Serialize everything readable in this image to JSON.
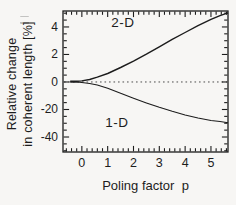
{
  "figure": {
    "background": "#f7f6f4",
    "line_color": "#1c1c1c",
    "zero_line_color": "#3a3a3a"
  },
  "chart_data": {
    "type": "line",
    "title": "",
    "x_axis": {
      "label": "Poling factor  p",
      "tick_labels": [
        "0",
        "1",
        "2",
        "3",
        "4",
        "5"
      ],
      "tick_values": [
        0,
        1,
        2,
        3,
        4,
        5
      ],
      "range": [
        -0.73,
        5.66
      ],
      "minor_step": 0.2,
      "grid": false
    },
    "y_axis": {
      "label_lines": [
        "Relative change",
        "in coherent length [%]"
      ],
      "tick_labels": [
        "4",
        "2",
        "0",
        "-20",
        "-40"
      ],
      "tick_values": [
        4,
        2,
        0,
        -20,
        -40
      ],
      "positive_units_per_division": 2,
      "negative_units_per_division": 20,
      "range_divisions": [
        -2.545,
        2.58
      ],
      "minor_step_divisions": 0.25,
      "grid": false
    },
    "zero_line": {
      "value": 0,
      "style": "dotted"
    },
    "series": [
      {
        "name": "2-D",
        "points": [
          [
            -0.45,
            0.05
          ],
          [
            -0.2,
            0.05
          ],
          [
            0,
            0.08
          ],
          [
            0.3,
            0.18
          ],
          [
            0.6,
            0.35
          ],
          [
            1,
            0.62
          ],
          [
            1.5,
            1.05
          ],
          [
            2,
            1.52
          ],
          [
            2.5,
            2.02
          ],
          [
            3,
            2.55
          ],
          [
            3.5,
            3.1
          ],
          [
            4,
            3.6
          ],
          [
            4.5,
            4.1
          ],
          [
            5,
            4.55
          ],
          [
            5.35,
            4.82
          ],
          [
            5.66,
            5.02
          ]
        ]
      },
      {
        "name": "1-D",
        "points": [
          [
            -0.45,
            -0.05
          ],
          [
            -0.2,
            -0.1
          ],
          [
            0,
            -0.3
          ],
          [
            0.3,
            -1.0
          ],
          [
            0.6,
            -2.2
          ],
          [
            1,
            -4.6
          ],
          [
            1.5,
            -8.2
          ],
          [
            2,
            -11.8
          ],
          [
            2.5,
            -15.2
          ],
          [
            3,
            -18.4
          ],
          [
            3.5,
            -21.3
          ],
          [
            4,
            -23.9
          ],
          [
            4.5,
            -26.1
          ],
          [
            5,
            -27.9
          ],
          [
            5.35,
            -28.8
          ],
          [
            5.66,
            -29.6
          ]
        ]
      }
    ]
  }
}
